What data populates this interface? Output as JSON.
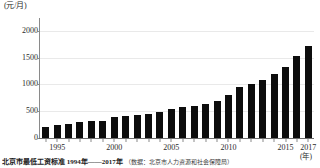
{
  "chart_data": {
    "type": "bar",
    "title": "",
    "subtitle": "",
    "xlabel": "(年)",
    "ylabel": "(元/月)",
    "ylim": [
      0,
      2200
    ],
    "yticks": [
      0,
      500,
      1000,
      1500,
      2000
    ],
    "ytick_labels": [
      "0",
      "500",
      "1000",
      "1500",
      "2000"
    ],
    "grid": true,
    "legend": "none",
    "bar_color": "#0d0d0d",
    "categories": [
      "1994",
      "1995",
      "1996",
      "1997",
      "1998",
      "1999",
      "2000",
      "2001",
      "2002",
      "2003",
      "2004",
      "2005",
      "2006",
      "2007",
      "2008",
      "2009",
      "2010",
      "2011",
      "2012",
      "2013",
      "2014",
      "2015",
      "2016",
      "2017"
    ],
    "xtick_labels": [
      "1995",
      "2000",
      "2005",
      "2010",
      "2015",
      "2017"
    ],
    "values": [
      210,
      240,
      270,
      290,
      310,
      320,
      400,
      410,
      435,
      455,
      490,
      545,
      580,
      600,
      640,
      690,
      800,
      960,
      1010,
      1090,
      1200,
      1320,
      1530,
      1720
    ],
    "series_name": "北京市最低工资标准"
  },
  "y_unit": "(元/月)",
  "x_unit": "(年)",
  "caption": {
    "text": "北京市最低工资标准 1994年——2017年",
    "source": "（数据：北京市人力资源和社会保障局）"
  }
}
